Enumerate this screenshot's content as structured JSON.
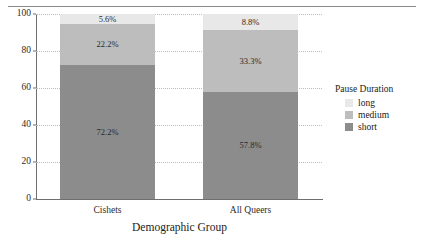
{
  "figure": {
    "top_bleed_text": "..........."
  },
  "chart_data": {
    "type": "bar",
    "stacked": true,
    "orientation": "vertical",
    "title": "",
    "xlabel": "Demographic Group",
    "ylabel": "",
    "ylim": [
      0,
      100
    ],
    "yticks": [
      0,
      20,
      40,
      60,
      80,
      100
    ],
    "ytick_labels": [
      "0",
      "20",
      "40",
      "60",
      "80",
      "100"
    ],
    "grid": "horizontal-dotted",
    "categories": [
      "Cishets",
      "All Queers"
    ],
    "legend": {
      "title": "Pause Duration",
      "position": "right",
      "entries": [
        {
          "name": "long",
          "color": "#e8e8e8"
        },
        {
          "name": "medium",
          "color": "#bdbdbd"
        },
        {
          "name": "short",
          "color": "#8c8c8c"
        }
      ]
    },
    "series": [
      {
        "name": "short",
        "color": "#8c8c8c",
        "values": [
          72.2,
          57.8
        ],
        "labels": [
          "72.2%",
          "57.8%"
        ]
      },
      {
        "name": "medium",
        "color": "#bdbdbd",
        "values": [
          22.2,
          33.3
        ],
        "labels": [
          "22.2%",
          "33.3%"
        ]
      },
      {
        "name": "long",
        "color": "#e8e8e8",
        "values": [
          5.6,
          8.8
        ],
        "labels": [
          "5.6%",
          "8.8%"
        ]
      }
    ],
    "colors": {
      "axis": "#6f6f6f",
      "grid": "#b4bfcb",
      "text": "#1a1a1a",
      "background": "#ffffff"
    }
  }
}
